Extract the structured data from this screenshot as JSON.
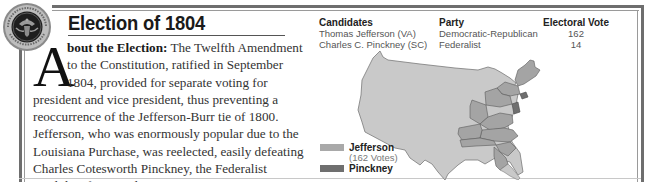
{
  "header": {
    "seal_icon": "presidential-seal",
    "title": "Election of 1804"
  },
  "article": {
    "drop_cap": "A",
    "lead": "bout the Election:",
    "lines": [
      " The Twelfth Amendment",
      "to the Constitution, ratified in September",
      "1804, provided for separate voting for",
      "president and vice president, thus preventing a",
      "reoccurrence of the Jefferson-Burr tie of 1800.",
      "Jefferson, who was enormously popular due to the",
      "Louisiana Purchase, was reelected, easily defeating",
      "Charles Cotesworth Pinckney, the Federalist",
      "candidate for president."
    ]
  },
  "results_table": {
    "headers": [
      "Candidates",
      "Party",
      "Electoral Vote"
    ],
    "rows": [
      [
        "Thomas Jefferson (VA)",
        "Democratic-Republican",
        "162"
      ],
      [
        "Charles C. Pinckney (SC)",
        "Federalist",
        "14"
      ]
    ]
  },
  "map": {
    "territory_color": "#c9c9c9",
    "border_color": "#7a7a7a"
  },
  "legend": {
    "items": [
      {
        "label": "Jefferson",
        "sub": "(162 Votes)",
        "color": "#a9a9a9"
      },
      {
        "label": "Pinckney",
        "sub": "",
        "color": "#6f6f6f"
      }
    ]
  }
}
